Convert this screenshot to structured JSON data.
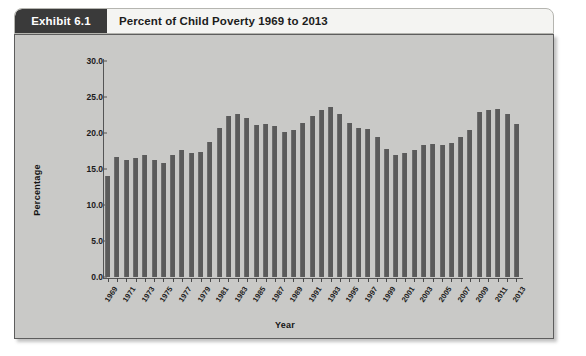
{
  "header": {
    "exhibit_label": "Exhibit 6.1",
    "title": "Percent of Child Poverty 1969 to 2013"
  },
  "chart_data": {
    "type": "bar",
    "title": "Percent of Child Poverty 1969 to 2013",
    "xlabel": "Year",
    "ylabel": "Percentage",
    "ylim": [
      0.0,
      30.0
    ],
    "yticks": [
      "0.0",
      "5.0",
      "10.0",
      "15.0",
      "20.0",
      "25.0",
      "30.0"
    ],
    "ytick_values": [
      0.0,
      5.0,
      10.0,
      15.0,
      20.0,
      25.0,
      30.0
    ],
    "grid": false,
    "legend": "none",
    "bar_color": "#5b5b5b",
    "plot_background": "#c9c9c7",
    "categories": [
      "1969",
      "1970",
      "1971",
      "1972",
      "1973",
      "1974",
      "1975",
      "1976",
      "1977",
      "1978",
      "1979",
      "1980",
      "1981",
      "1982",
      "1983",
      "1984",
      "1985",
      "1986",
      "1987",
      "1988",
      "1989",
      "1990",
      "1991",
      "1992",
      "1993",
      "1994",
      "1995",
      "1996",
      "1997",
      "1998",
      "1999",
      "2000",
      "2001",
      "2002",
      "2003",
      "2004",
      "2005",
      "2006",
      "2007",
      "2008",
      "2009",
      "2010",
      "2011",
      "2012",
      "2013"
    ],
    "tick_labels": [
      "1969",
      "",
      "1971",
      "",
      "1973",
      "",
      "1975",
      "",
      "1977",
      "",
      "1979",
      "",
      "1981",
      "",
      "1983",
      "",
      "1985",
      "",
      "1987",
      "",
      "1989",
      "",
      "1991",
      "",
      "1993",
      "",
      "1995",
      "",
      "1997",
      "",
      "1999",
      "",
      "2001",
      "",
      "2003",
      "",
      "2005",
      "",
      "2007",
      "",
      "2009",
      "",
      "2011",
      "",
      "2013"
    ],
    "values": [
      14.0,
      16.7,
      16.2,
      16.5,
      16.9,
      16.3,
      15.8,
      16.9,
      17.7,
      17.2,
      17.3,
      18.8,
      20.7,
      22.3,
      22.6,
      22.1,
      21.1,
      21.2,
      21.0,
      20.1,
      20.4,
      21.4,
      22.4,
      23.2,
      23.6,
      22.7,
      21.4,
      20.7,
      20.5,
      19.5,
      17.8,
      17.0,
      17.2,
      17.6,
      18.4,
      18.5,
      18.4,
      18.6,
      19.5,
      20.4,
      22.9,
      23.2,
      23.3,
      22.6,
      21.2
    ]
  }
}
